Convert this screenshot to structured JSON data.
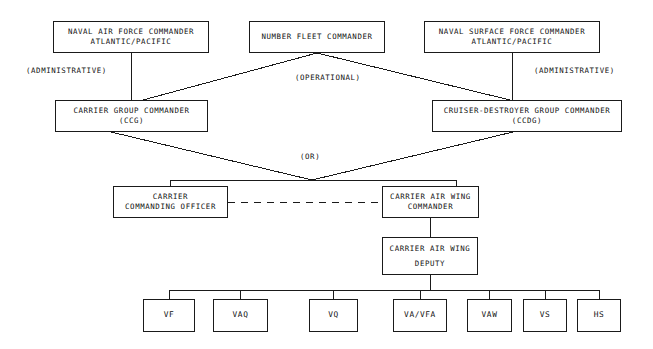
{
  "diagram": {
    "type": "org-chart",
    "line_color": "#1a1a1a",
    "background_color": "#ffffff",
    "nodes": [
      {
        "id": "naf",
        "lines": [
          "NAVAL AIR FORCE COMMANDER",
          "ATLANTIC/PACIFIC"
        ],
        "x": 53,
        "y": 21,
        "w": 156,
        "h": 32
      },
      {
        "id": "nfc",
        "lines": [
          "NUMBER FLEET COMMANDER"
        ],
        "x": 249,
        "y": 21,
        "w": 136,
        "h": 32
      },
      {
        "id": "nsf",
        "lines": [
          "NAVAL SURFACE FORCE COMMANDER",
          "ATLANTIC/PACIFIC"
        ],
        "x": 424,
        "y": 21,
        "w": 176,
        "h": 32
      },
      {
        "id": "ccg",
        "lines": [
          "CARRIER GROUP COMMANDER",
          "(CCG)"
        ],
        "x": 55,
        "y": 100,
        "w": 153,
        "h": 32
      },
      {
        "id": "ccdg",
        "lines": [
          "CRUISER-DESTROYER GROUP COMMANDER",
          "(CCDG)"
        ],
        "x": 432,
        "y": 100,
        "w": 190,
        "h": 32
      },
      {
        "id": "cco",
        "lines": [
          "CARRIER",
          "COMMANDING OFFICER"
        ],
        "x": 113,
        "y": 186,
        "w": 115,
        "h": 32
      },
      {
        "id": "cawc",
        "lines": [
          "CARRIER AIR WING",
          "COMMANDER"
        ],
        "x": 382,
        "y": 186,
        "w": 97,
        "h": 32
      },
      {
        "id": "cawd",
        "lines": [
          "CARRIER AIR WING",
          "DEPUTY"
        ],
        "x": 382,
        "y": 237,
        "w": 96,
        "h": 38
      }
    ],
    "leaf_nodes": [
      {
        "id": "vf",
        "label": "VF",
        "x": 143,
        "y": 299,
        "w": 52,
        "h": 33
      },
      {
        "id": "vaq",
        "label": "VAQ",
        "x": 213,
        "y": 299,
        "w": 55,
        "h": 33
      },
      {
        "id": "vq",
        "label": "VQ",
        "x": 309,
        "y": 299,
        "w": 49,
        "h": 33
      },
      {
        "id": "vavfa",
        "label": "VA/VFA",
        "x": 393,
        "y": 299,
        "w": 54,
        "h": 33
      },
      {
        "id": "vaw",
        "label": "VAW",
        "x": 467,
        "y": 299,
        "w": 45,
        "h": 33
      },
      {
        "id": "vs",
        "label": "VS",
        "x": 523,
        "y": 299,
        "w": 44,
        "h": 33
      },
      {
        "id": "hs",
        "label": "HS",
        "x": 577,
        "y": 299,
        "w": 44,
        "h": 33
      }
    ],
    "edge_labels": [
      {
        "id": "admin-left",
        "text": "(ADMINISTRATIVE)",
        "x": 26,
        "y": 66
      },
      {
        "id": "operational",
        "text": "(OPERATIONAL)",
        "x": 295,
        "y": 73
      },
      {
        "id": "admin-right",
        "text": "(ADMINISTRATIVE)",
        "x": 534,
        "y": 66
      },
      {
        "id": "or",
        "text": "(OR)",
        "x": 300,
        "y": 152
      }
    ],
    "connections": [
      {
        "from": "naf",
        "to": "ccg",
        "style": "solid",
        "kind": "administrative"
      },
      {
        "from": "nfc",
        "to": "ccg",
        "style": "solid",
        "kind": "operational"
      },
      {
        "from": "nfc",
        "to": "ccdg",
        "style": "solid",
        "kind": "operational"
      },
      {
        "from": "nsf",
        "to": "ccdg",
        "style": "solid",
        "kind": "administrative"
      },
      {
        "from": "ccg",
        "to": "cco",
        "style": "solid",
        "kind": "or"
      },
      {
        "from": "ccdg",
        "to": "cawc",
        "style": "solid",
        "kind": "or"
      },
      {
        "from": "cco",
        "to": "cawc",
        "style": "dashed",
        "kind": "coordination"
      },
      {
        "from": "cawc",
        "to": "cawd",
        "style": "solid",
        "kind": "direct"
      },
      {
        "from": "cawd",
        "to": "squadrons",
        "style": "solid",
        "kind": "direct"
      }
    ]
  }
}
